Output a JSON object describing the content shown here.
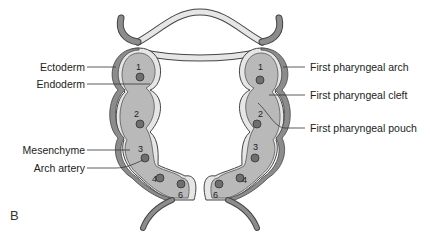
{
  "panel_label": "B",
  "left_labels": {
    "ectoderm": "Ectoderm",
    "endoderm": "Endoderm",
    "mesenchyme": "Mesenchyme",
    "arch_artery": "Arch artery"
  },
  "right_labels": {
    "arch": "First pharyngeal arch",
    "cleft": "First pharyngeal cleft",
    "pouch": "First pharyngeal pouch"
  },
  "arch_numbers": {
    "left": [
      "1",
      "2",
      "3",
      "4",
      "6"
    ],
    "right": [
      "1",
      "2",
      "3",
      "4",
      "6"
    ]
  },
  "colors": {
    "ectoderm": "#8c8c8c",
    "endoderm": "#e6e6e6",
    "mesenchyme": "#b9b9b9",
    "artery": "#6f6f6f",
    "outline": "#444444",
    "leader": "#333333"
  }
}
